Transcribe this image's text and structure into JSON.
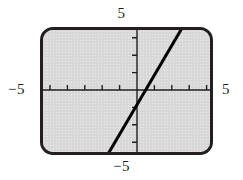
{
  "figure": {
    "name": "graphing-calculator-line-plot",
    "background_color": "#ffffff",
    "screen_color": "#d9d9d9",
    "frame_color": "#231f20",
    "curve_color": "#000000"
  },
  "axis_labels": {
    "top": "5",
    "bottom": "−5",
    "left": "−5",
    "right": "5"
  },
  "chart_data": {
    "type": "line",
    "title": "",
    "xlabel": "",
    "ylabel": "",
    "xlim": [
      -5,
      5
    ],
    "ylim": [
      -5,
      5
    ],
    "xticks": [
      -5,
      -4,
      -3,
      -2,
      -1,
      1,
      2,
      3,
      4,
      5
    ],
    "yticks": [
      -5,
      -4,
      -3,
      -2,
      -1,
      1,
      2,
      3,
      4,
      5
    ],
    "xtick_labels": [
      "-5",
      "",
      "",
      "",
      "",
      "",
      "",
      "",
      "",
      "5"
    ],
    "ytick_labels": [
      "-5",
      "",
      "",
      "",
      "",
      "",
      "",
      "",
      "",
      "5"
    ],
    "grid": false,
    "legend": false,
    "axes_style": "centered-crosshair-with-tick-marks",
    "series": [
      {
        "name": "line",
        "slope": 1.7,
        "intercept": -0.85,
        "x": [
          -2.5,
          2.7
        ],
        "y": [
          -5.1,
          3.75
        ],
        "line_width_px": 3,
        "color": "#000000"
      }
    ]
  }
}
